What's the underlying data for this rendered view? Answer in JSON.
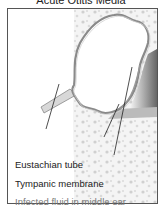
{
  "title": "Acute Otitis Media",
  "labels": {
    "eustachian_tube": "Eustachian tube",
    "tympanic_membrane": "Tympanic membrane",
    "infected_fluid": "Infected fluid in middle ear"
  },
  "colors": {
    "frame_border": "#555555",
    "outline": "#7a7a7a",
    "label_dark": "#222222",
    "label_light": "#777777"
  }
}
